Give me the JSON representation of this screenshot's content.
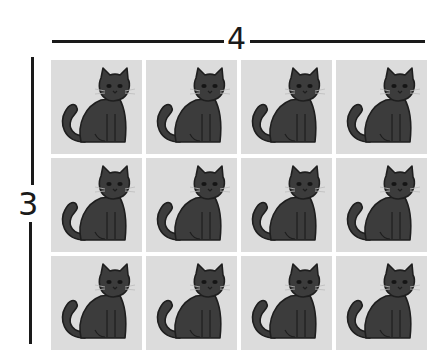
{
  "diagram": {
    "type": "array-multiplication",
    "columns_label": "4",
    "rows_label": "3",
    "columns": 4,
    "rows": 3,
    "colors": {
      "cell_background": "#dcdcdc",
      "line": "#1a1a1a",
      "white_cat_fill": "#f4f4f4",
      "gray_cat_fill": "#6e6e6e",
      "dark_cat_fill": "#3c3c3c"
    },
    "grid": [
      [
        "white-cat",
        "white-cat",
        "white-cat",
        "white-cat"
      ],
      [
        "gray-cat",
        "gray-cat",
        "gray-cat",
        "gray-cat"
      ],
      [
        "dark-cat",
        "dark-cat",
        "dark-cat",
        "dark-cat"
      ]
    ]
  }
}
